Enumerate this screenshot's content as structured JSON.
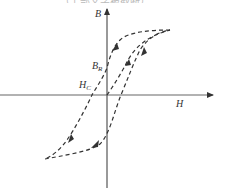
{
  "caption_fragment": "……（上部文字被截断）……",
  "diagram": {
    "type": "hysteresis_loop",
    "axes": {
      "x_label": "H",
      "y_label": "B"
    },
    "annotations": {
      "remanence": "B",
      "remanence_sub": "R",
      "coercivity": "H",
      "coercivity_sub": "C"
    },
    "curves": [
      {
        "name": "initial-magnetization-curve",
        "style": "dashed",
        "from": "origin",
        "to": "saturation-tip"
      },
      {
        "name": "descending-branch",
        "style": "dashed",
        "from": "positive-saturation",
        "to": "negative-saturation",
        "passes": [
          "B_R",
          "H_C"
        ]
      },
      {
        "name": "ascending-branch",
        "style": "dashed",
        "from": "negative-saturation",
        "to": "positive-saturation"
      }
    ],
    "colors": {
      "line": "#333333",
      "axis": "#555555",
      "background": "#ffffff"
    }
  }
}
